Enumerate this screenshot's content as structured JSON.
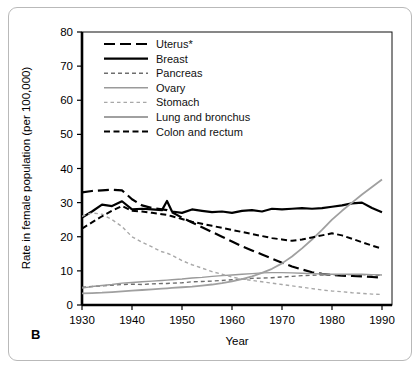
{
  "panel": {
    "label": "B"
  },
  "chart_data": {
    "type": "line",
    "title": "",
    "xlabel": "Year",
    "ylabel": "Rate in female population (per 100,000)",
    "xlim": [
      1930,
      1992
    ],
    "ylim": [
      0,
      80
    ],
    "xticks": [
      1930,
      1940,
      1950,
      1960,
      1970,
      1980,
      1990
    ],
    "yticks": [
      0,
      10,
      20,
      30,
      40,
      50,
      60,
      70,
      80
    ],
    "grid": false,
    "legend_position": "top-left-inside",
    "footnote": "* Uterus rates include uterine cervix and uterine corpus.",
    "x": [
      1930,
      1932,
      1934,
      1936,
      1938,
      1940,
      1942,
      1944,
      1946,
      1947,
      1948,
      1950,
      1952,
      1954,
      1956,
      1958,
      1960,
      1962,
      1964,
      1966,
      1968,
      1970,
      1972,
      1974,
      1976,
      1978,
      1980,
      1982,
      1984,
      1986,
      1988,
      1990
    ],
    "series": [
      {
        "name": "Uterus*",
        "style": "long-dash",
        "color": "#000000",
        "width": 2.2,
        "values": [
          33.0,
          33.4,
          33.6,
          33.8,
          33.6,
          31.0,
          29.2,
          28.4,
          28.0,
          27.8,
          27.2,
          25.6,
          24.2,
          22.8,
          21.4,
          20.0,
          18.6,
          17.2,
          16.0,
          14.8,
          13.6,
          12.4,
          11.3,
          10.4,
          9.6,
          9.1,
          8.8,
          8.6,
          8.5,
          8.4,
          8.2,
          8.0
        ]
      },
      {
        "name": "Breast",
        "style": "solid",
        "color": "#000000",
        "width": 2.2,
        "values": [
          25.6,
          27.4,
          29.4,
          29.0,
          30.4,
          28.0,
          28.2,
          28.0,
          27.8,
          30.5,
          27.4,
          27.0,
          28.0,
          27.6,
          27.2,
          27.4,
          27.0,
          27.6,
          27.8,
          27.4,
          28.2,
          28.0,
          28.2,
          28.4,
          28.2,
          28.4,
          28.8,
          29.2,
          29.8,
          30.0,
          28.4,
          27.2
        ]
      },
      {
        "name": "Pancreas",
        "style": "short-dash",
        "color": "#6e6e6e",
        "width": 1.4,
        "values": [
          5.2,
          5.4,
          5.6,
          5.8,
          6.0,
          6.1,
          6.0,
          6.2,
          6.3,
          6.3,
          6.4,
          6.5,
          6.8,
          6.9,
          7.0,
          7.2,
          7.4,
          7.6,
          7.8,
          7.9,
          8.0,
          8.2,
          8.4,
          8.6,
          8.7,
          8.8,
          8.8,
          8.9,
          8.9,
          8.9,
          8.8,
          8.7
        ]
      },
      {
        "name": "Ovary",
        "style": "solid",
        "color": "#9a9a9a",
        "width": 1.4,
        "values": [
          5.0,
          5.4,
          5.7,
          6.0,
          6.4,
          6.6,
          6.8,
          7.0,
          7.2,
          7.3,
          7.4,
          7.6,
          7.9,
          8.1,
          8.4,
          8.6,
          8.8,
          9.0,
          9.2,
          9.4,
          9.5,
          9.5,
          9.4,
          9.3,
          9.2,
          9.1,
          9.0,
          9.0,
          9.0,
          9.0,
          8.9,
          8.8
        ]
      },
      {
        "name": "Stomach",
        "style": "dotted-dash",
        "color": "#a8a8a8",
        "width": 1.4,
        "values": [
          26.0,
          27.0,
          26.6,
          25.0,
          23.0,
          20.0,
          18.4,
          17.0,
          15.6,
          15.2,
          14.6,
          13.0,
          11.8,
          10.8,
          9.8,
          9.0,
          8.2,
          7.6,
          7.2,
          6.8,
          6.4,
          6.0,
          5.6,
          5.2,
          4.8,
          4.4,
          4.1,
          3.9,
          3.6,
          3.4,
          3.2,
          3.1
        ]
      },
      {
        "name": "Lung and bronchus",
        "style": "solid",
        "color": "#a0a0a0",
        "width": 1.8,
        "values": [
          3.4,
          3.5,
          3.6,
          3.8,
          4.0,
          4.2,
          4.4,
          4.6,
          4.8,
          4.9,
          5.0,
          5.2,
          5.4,
          5.7,
          6.0,
          6.4,
          6.9,
          7.6,
          8.4,
          9.4,
          10.6,
          12.2,
          14.2,
          16.6,
          19.2,
          22.0,
          25.0,
          27.6,
          30.0,
          32.4,
          34.6,
          36.8
        ]
      },
      {
        "name": "Colon and rectum",
        "style": "medium-dash",
        "color": "#000000",
        "width": 2.0,
        "values": [
          22.4,
          24.2,
          26.0,
          27.6,
          29.0,
          27.6,
          27.4,
          27.0,
          26.6,
          26.4,
          26.0,
          25.2,
          24.4,
          23.8,
          23.2,
          22.6,
          22.0,
          21.4,
          20.8,
          20.2,
          19.6,
          19.2,
          18.8,
          19.2,
          19.8,
          20.4,
          21.0,
          20.4,
          19.4,
          18.4,
          17.4,
          16.5
        ]
      }
    ]
  }
}
